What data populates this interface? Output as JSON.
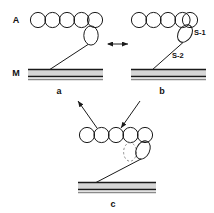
{
  "figure": {
    "type": "schematic",
    "background_color": "#ffffff",
    "line_color": "#1a1a1a",
    "filament_fill": "#d6d6d6"
  },
  "axis_labels": {
    "actin": "A",
    "myosin": "M"
  },
  "segment_labels": {
    "s1": "S-1",
    "s2": "S-2"
  },
  "panels": [
    {
      "id": "a",
      "label": "a",
      "actin_monomers": 5,
      "head_state": "vertical",
      "head_ghost": false
    },
    {
      "id": "b",
      "label": "b",
      "actin_monomers": 5,
      "head_state": "tilted",
      "head_ghost": false
    },
    {
      "id": "c",
      "label": "c",
      "actin_monomers": 5,
      "head_state": "tilted",
      "head_ghost": true
    }
  ],
  "arrows": [
    {
      "name": "a-b-equilibrium",
      "style": "double-headed",
      "orientation": "horizontal"
    },
    {
      "name": "a-to-c",
      "style": "single-headed",
      "orientation": "diagonal-down-left"
    },
    {
      "name": "b-to-c",
      "style": "single-headed",
      "orientation": "diagonal-down-right"
    }
  ]
}
